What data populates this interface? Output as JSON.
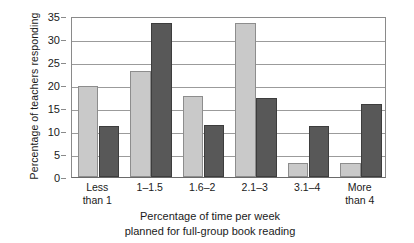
{
  "chart_data": {
    "type": "bar",
    "title": "",
    "xlabel": "Percentage of time per week planned for full-group book reading",
    "xlabel_line1": "Percentage of time per week",
    "xlabel_line2": "planned for full-group book reading",
    "ylabel": "Percentage of teachers responding",
    "ylim": [
      0,
      35
    ],
    "ytick_step": 5,
    "yticks": [
      "0",
      "5",
      "10",
      "15",
      "20",
      "25",
      "30",
      "35"
    ],
    "ytick_values": [
      0,
      5,
      10,
      15,
      20,
      25,
      30,
      35
    ],
    "grid": true,
    "legend": "none",
    "categories": [
      "Less than 1",
      "1–1.5",
      "1.6–2",
      "2.1–3",
      "3.1–4",
      "More than 4"
    ],
    "category_lines": [
      [
        "Less",
        "than 1"
      ],
      [
        "1–1.5",
        ""
      ],
      [
        "1.6–2",
        ""
      ],
      [
        "2.1–3",
        ""
      ],
      [
        "3.1–4",
        ""
      ],
      [
        "More",
        "than 4"
      ]
    ],
    "series": [
      {
        "name": "series-1",
        "color": "#c9c9c9",
        "values": [
          19.7,
          23.0,
          17.7,
          33.5,
          3.0,
          3.0
        ]
      },
      {
        "name": "series-2",
        "color": "#585858",
        "values": [
          11.0,
          33.5,
          11.2,
          17.2,
          11.0,
          15.8
        ]
      }
    ]
  },
  "colors": {
    "light_bar": "#c9c9c9",
    "light_bar_edge": "#8d8d8d",
    "dark_bar": "#585858",
    "dark_bar_edge": "#3d3d3d",
    "gridline": "#9b9b9b",
    "axis": "#8a8a8a",
    "text": "#1a1a1a",
    "background": "#ffffff"
  }
}
